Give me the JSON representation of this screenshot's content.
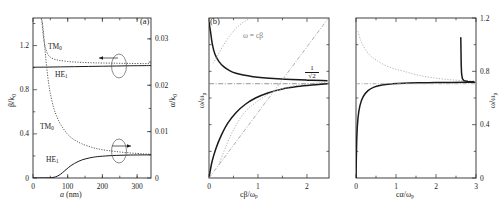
{
  "figure": {
    "caption_ids": [
      "(a)",
      "(b)"
    ],
    "panel_a_id": "(a)",
    "panel_b_id": "(b)"
  },
  "chart_data": [
    {
      "type": "line",
      "panel": "(a)",
      "title": "",
      "xlabel": "a (nm)",
      "ylabel": "β/k₀",
      "ylabel_right": "α/k₀",
      "xlim": [
        0,
        340
      ],
      "ylim": [
        0,
        1.45
      ],
      "ylim_right": [
        0,
        0.0345
      ],
      "xticks": [
        0,
        100,
        200,
        300
      ],
      "xticklabels": [
        "0",
        "100",
        "200",
        "300"
      ],
      "yticks": [
        0,
        0.4,
        0.8,
        1.2
      ],
      "yticklabels": [
        "0",
        "0.4",
        "0.8",
        "1.2"
      ],
      "yticks_right": [
        0,
        0.01,
        0.02,
        0.03
      ],
      "yticklabels_right": [
        "0",
        "0.01",
        "0.02",
        "0.03"
      ],
      "grid": false,
      "legend": "none",
      "annotations": [
        {
          "text": "TM₀",
          "note": "upper dotted curve, left axis"
        },
        {
          "text": "HE₁",
          "note": "upper solid curve, left axis"
        },
        {
          "text": "TM₀",
          "note": "lower dotted curve, right axis"
        },
        {
          "text": "HE₁",
          "note": "lower solid curve, right axis"
        },
        {
          "text": "←",
          "note": "arrow pointing to left axis"
        },
        {
          "text": "→",
          "note": "arrow pointing to right axis"
        }
      ],
      "series": [
        {
          "name": "TM0 beta/k0",
          "style": "dotted",
          "x": [
            24,
            26,
            28,
            30,
            33,
            36,
            40,
            45,
            50,
            60,
            70,
            80,
            100,
            120,
            140,
            170,
            200,
            240,
            280,
            320,
            340
          ],
          "y": [
            1.44,
            1.4,
            1.34,
            1.28,
            1.22,
            1.18,
            1.14,
            1.11,
            1.095,
            1.078,
            1.07,
            1.064,
            1.056,
            1.051,
            1.048,
            1.044,
            1.042,
            1.04,
            1.038,
            1.037,
            1.036
          ]
        },
        {
          "name": "HE1 beta/k0",
          "style": "solid",
          "x": [
            0,
            40,
            80,
            120,
            160,
            200,
            240,
            280,
            320,
            340
          ],
          "y": [
            1.004,
            1.005,
            1.007,
            1.009,
            1.011,
            1.013,
            1.015,
            1.017,
            1.018,
            1.019
          ]
        },
        {
          "name": "TM0 alpha/k0",
          "style": "dotted",
          "x": [
            24,
            26,
            28,
            30,
            33,
            36,
            40,
            45,
            50,
            60,
            70,
            80,
            100,
            120,
            140,
            170,
            200,
            240,
            280,
            320,
            340
          ],
          "y": [
            0.0345,
            0.034,
            0.033,
            0.0315,
            0.029,
            0.0265,
            0.0235,
            0.0205,
            0.0182,
            0.015,
            0.013,
            0.0115,
            0.0094,
            0.0082,
            0.0074,
            0.0066,
            0.0061,
            0.0057,
            0.0054,
            0.0052,
            0.0051
          ]
        },
        {
          "name": "HE1 alpha/k0",
          "style": "solid",
          "x": [
            0,
            40,
            55,
            65,
            75,
            85,
            95,
            110,
            130,
            150,
            175,
            200,
            240,
            280,
            320,
            340
          ],
          "y": [
            2e-05,
            4e-05,
            0.0001,
            0.00025,
            0.0006,
            0.00115,
            0.0018,
            0.0027,
            0.00355,
            0.0041,
            0.0045,
            0.0047,
            0.00488,
            0.00495,
            0.00498,
            0.00499
          ]
        }
      ]
    },
    {
      "type": "line",
      "panel": "(b)",
      "title": "",
      "xlabel": "cβ/ωₚ",
      "ylabel": "ω/ωₚ",
      "xlim": [
        0,
        2.45
      ],
      "ylim": [
        0,
        1.2
      ],
      "xticks": [
        0,
        1,
        2
      ],
      "xticklabels": [
        "0",
        "1",
        "2"
      ],
      "grid": false,
      "legend": "none",
      "annotations": [
        {
          "text": "ω = cβ",
          "note": "light line, light cone"
        },
        {
          "text": "1/√2",
          "note": "surface plasmon asymptote, dash-dot horizontal line"
        }
      ],
      "asymptote": 0.7071,
      "series": [
        {
          "name": "upper branch (radiative)",
          "style": "solid-thick",
          "x": [
            0.0,
            0.03,
            0.07,
            0.12,
            0.2,
            0.3,
            0.42,
            0.55,
            0.7,
            0.9,
            1.1,
            1.4,
            1.7,
            2.0,
            2.3,
            2.42
          ],
          "y": [
            1.17,
            1.1,
            1.0,
            0.93,
            0.875,
            0.835,
            0.805,
            0.785,
            0.772,
            0.76,
            0.752,
            0.744,
            0.738,
            0.734,
            0.731,
            0.73
          ]
        },
        {
          "name": "lower branch (bound SP)",
          "style": "solid-thick",
          "x": [
            0.0,
            0.06,
            0.14,
            0.25,
            0.38,
            0.55,
            0.75,
            0.95,
            1.2,
            1.5,
            1.8,
            2.1,
            2.35,
            2.42
          ],
          "y": [
            0.0,
            0.12,
            0.22,
            0.32,
            0.41,
            0.49,
            0.555,
            0.6,
            0.638,
            0.668,
            0.686,
            0.698,
            0.705,
            0.707
          ]
        },
        {
          "name": "light line omega = c beta",
          "style": "dash-dot-light",
          "x": [
            0.0,
            2.42
          ],
          "y": [
            0.0,
            1.19
          ]
        },
        {
          "name": "dotted auxiliary upper",
          "style": "dotted-light",
          "x": [
            0.08,
            0.18,
            0.3,
            0.45,
            0.6,
            0.8,
            1.0,
            1.3,
            1.7,
            2.1,
            2.42
          ],
          "y": [
            0.86,
            0.92,
            1.0,
            1.08,
            1.14,
            1.19,
            1.2,
            1.2,
            1.2,
            1.2,
            1.2
          ]
        },
        {
          "name": "dotted auxiliary lower",
          "style": "dotted-light",
          "x": [
            0.2,
            0.35,
            0.5,
            0.7,
            0.95,
            1.25,
            1.6,
            2.0,
            2.3,
            2.42
          ],
          "y": [
            0.1,
            0.24,
            0.36,
            0.48,
            0.565,
            0.635,
            0.68,
            0.705,
            0.715,
            0.718
          ]
        }
      ]
    },
    {
      "type": "line",
      "panel": "(c)",
      "title": "",
      "xlabel": "cα/ωₚ",
      "ylabel": "ω/ωₚ",
      "xlim": [
        0,
        3
      ],
      "ylim": [
        0,
        1.2
      ],
      "xticks": [
        0,
        1,
        2,
        3
      ],
      "xticklabels": [
        "0",
        "1",
        "2",
        "3"
      ],
      "yticks": [
        0,
        0.4,
        0.8,
        1.2
      ],
      "yticklabels": [
        "0",
        "0.4",
        "0.8",
        "1.2"
      ],
      "grid": false,
      "legend": "none",
      "asymptote": 0.7071,
      "series": [
        {
          "name": "upper branch decaying",
          "style": "dotted-light",
          "x": [
            0.05,
            0.12,
            0.22,
            0.35,
            0.5,
            0.7,
            0.95,
            1.2,
            1.5,
            1.8,
            2.1,
            2.4,
            2.6,
            2.8,
            2.95
          ],
          "y": [
            1.1,
            1.03,
            0.97,
            0.92,
            0.885,
            0.85,
            0.82,
            0.8,
            0.775,
            0.758,
            0.745,
            0.736,
            0.732,
            0.729,
            0.728
          ]
        },
        {
          "name": "lower branch rising",
          "style": "solid-thick",
          "x": [
            0.0,
            0.02,
            0.05,
            0.1,
            0.18,
            0.3,
            0.45,
            0.65,
            0.9,
            1.2,
            1.6,
            2.0,
            2.4,
            2.7,
            2.9,
            2.98
          ],
          "y": [
            0.0,
            0.3,
            0.45,
            0.545,
            0.61,
            0.655,
            0.682,
            0.698,
            0.706,
            0.711,
            0.714,
            0.716,
            0.717,
            0.718,
            0.718,
            0.718
          ]
        },
        {
          "name": "resonance spike",
          "style": "solid-thick",
          "x": [
            2.6,
            2.62,
            2.625,
            2.63,
            2.64,
            2.66,
            2.7,
            2.8,
            2.95
          ],
          "y": [
            1.05,
            1.05,
            0.95,
            0.85,
            0.78,
            0.745,
            0.73,
            0.724,
            0.722
          ]
        },
        {
          "name": "asymptote line",
          "style": "dash-dot-light",
          "x": [
            0.0,
            2.98
          ],
          "y": [
            0.7071,
            0.7071
          ]
        }
      ]
    }
  ],
  "panel_a": {
    "xlabel_main": "a",
    "xlabel_unit": "(nm)",
    "ylabel_beta": "β/k",
    "ylabel_beta_sub": "0",
    "ylabel_alpha": "α/k",
    "ylabel_alpha_sub": "0",
    "xticklabels": [
      "0",
      "100",
      "200",
      "300"
    ],
    "yticklabels_left": [
      "0",
      "0.4",
      "0.8",
      "1.2"
    ],
    "yticklabels_right": [
      "0",
      "0.01",
      "0.02",
      "0.03"
    ],
    "curve_labels": {
      "tm0_upper": "TM",
      "tm0_upper_sub": "0",
      "he1_upper": "HE",
      "he1_upper_sub": "1",
      "tm0_lower": "TM",
      "tm0_lower_sub": "0",
      "he1_lower": "HE",
      "he1_lower_sub": "1"
    }
  },
  "panel_b": {
    "xlabel": "cβ/ω",
    "xlabel_sub": "p",
    "ylabel": "ω/ω",
    "ylabel_sub": "p",
    "xticklabels": [
      "0",
      "1",
      "2"
    ],
    "lightline_label": "ω = cβ",
    "asymptote_num": "1",
    "asymptote_den": "√2"
  },
  "panel_c": {
    "xlabel": "cα/ω",
    "xlabel_sub": "p",
    "ylabel": "ω/ω",
    "ylabel_sub": "p",
    "xticklabels": [
      "0",
      "1",
      "2",
      "3"
    ],
    "yticklabels_right": [
      "0",
      "0.4",
      "0.8",
      "1.2"
    ]
  },
  "colors": {
    "axis": "#2b2b2b",
    "curve_dark": "#1a1a1a",
    "curve_light": "#9a9a9a",
    "background": "#ffffff"
  }
}
